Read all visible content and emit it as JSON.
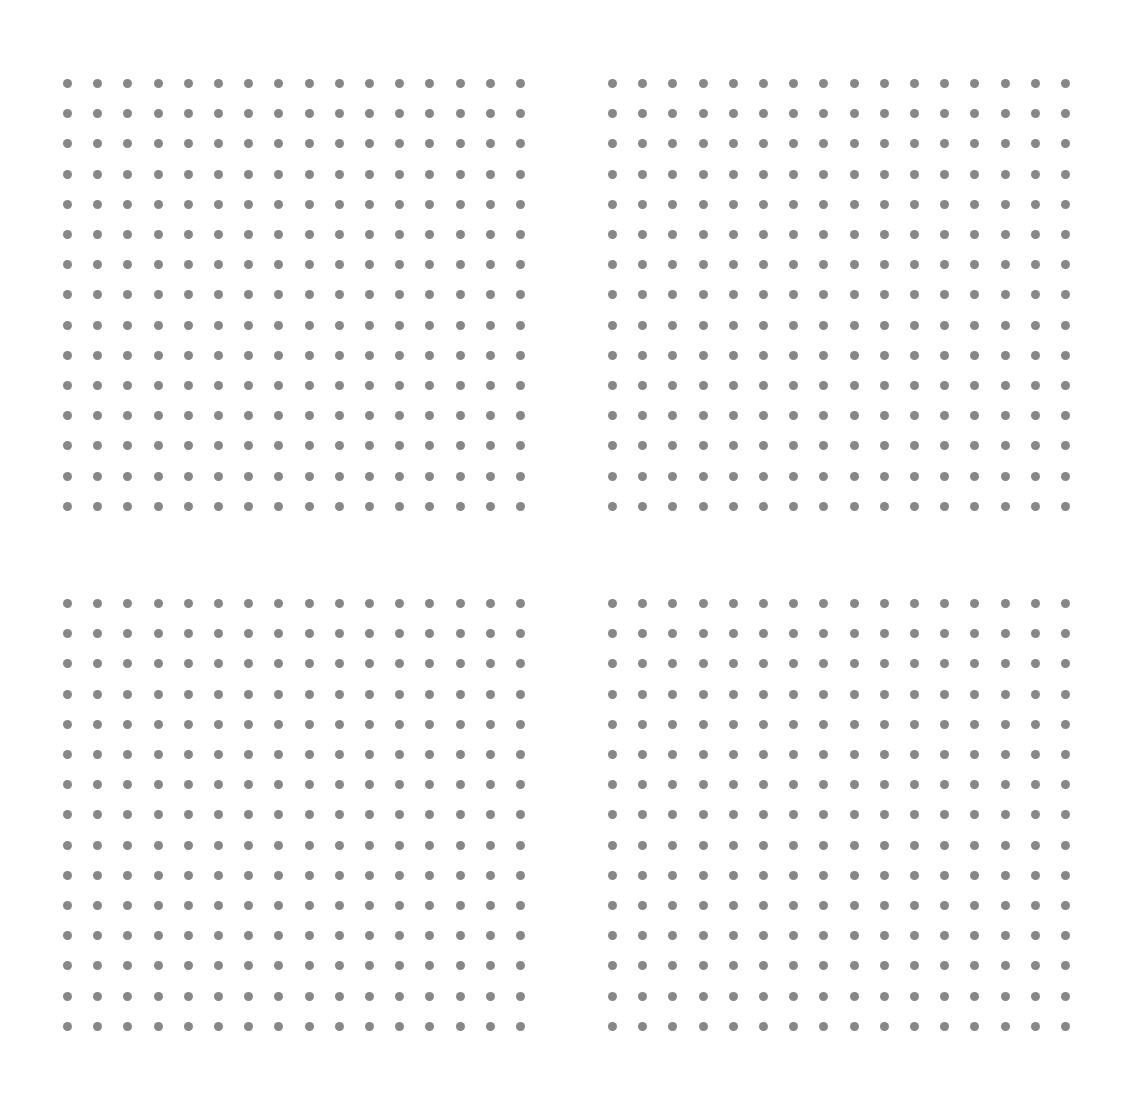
{
  "canvas": {
    "width": 1131,
    "height": 1105,
    "background_color": "#ffffff",
    "description": "dot-grid-pattern"
  },
  "dot_style": {
    "shape": "circle",
    "diameter_px": 9,
    "color": "#878787",
    "opacity": 1,
    "blur_px": 0.35
  },
  "grid": {
    "column_pitch_px": 30.2,
    "row_pitch_px": 30.2,
    "blocks_across": 2,
    "blocks_down": 2,
    "horizontal_block_gap_px": 84,
    "vertical_block_gap_px": 70
  },
  "blocks": [
    {
      "name": "top-left",
      "columns": 16,
      "rows": 15,
      "origin_x": 57,
      "origin_y": 73
    },
    {
      "name": "top-right",
      "columns": 16,
      "rows": 15,
      "origin_x": 602,
      "origin_y": 73
    },
    {
      "name": "bottom-left",
      "columns": 16,
      "rows": 15,
      "origin_x": 57,
      "origin_y": 593
    },
    {
      "name": "bottom-right",
      "columns": 16,
      "rows": 15,
      "origin_x": 602,
      "origin_y": 593
    }
  ],
  "chart_data": {
    "type": "scatter",
    "title": "",
    "subtitle": "",
    "xlabel": "",
    "ylabel": "",
    "grid": false,
    "legend_position": "none",
    "xlim": [
      0,
      1131
    ],
    "ylim": [
      0,
      1105
    ],
    "tick_labels_x": [],
    "tick_labels_y": [],
    "annotations": [],
    "marker": {
      "symbol": "circle",
      "size_px": 9,
      "color": "#878787"
    },
    "series": [
      {
        "name": "top-left",
        "point_count": 240,
        "columns": 16,
        "rows": 15,
        "x_start": 57,
        "y_start": 73,
        "x_step": 30.2,
        "y_step": 30.2
      },
      {
        "name": "top-right",
        "point_count": 240,
        "columns": 16,
        "rows": 15,
        "x_start": 602,
        "y_start": 73,
        "x_step": 30.2,
        "y_step": 30.2
      },
      {
        "name": "bottom-left",
        "point_count": 240,
        "columns": 16,
        "rows": 15,
        "x_start": 57,
        "y_start": 593,
        "x_step": 30.2,
        "y_step": 30.2
      },
      {
        "name": "bottom-right",
        "point_count": 240,
        "columns": 16,
        "rows": 15,
        "x_start": 602,
        "y_start": 593,
        "x_step": 30.2,
        "y_step": 30.2
      }
    ],
    "total_points": 960
  }
}
